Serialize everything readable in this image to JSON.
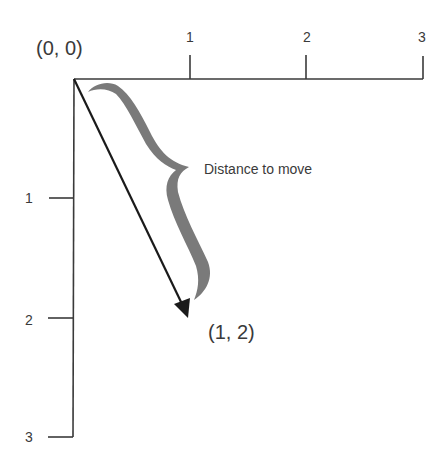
{
  "diagram": {
    "title": "",
    "origin": {
      "label": "(0, 0)",
      "px": [
        74,
        79
      ]
    },
    "x_axis": {
      "ticks": [
        {
          "label": "1",
          "px": 190
        },
        {
          "label": "2",
          "px": 306
        },
        {
          "label": "3",
          "px": 423
        }
      ]
    },
    "y_axis": {
      "ticks": [
        {
          "label": "1",
          "px": 198
        },
        {
          "label": "2",
          "px": 318
        },
        {
          "label": "3",
          "px": 437
        }
      ]
    },
    "vector": {
      "from": "(0, 0)",
      "to_label": "(1, 2)",
      "color": "#1a1a1a"
    },
    "brace": {
      "label": "Distance to move",
      "color": "#7a7a7a"
    },
    "colors": {
      "axis": "#3a3a3a",
      "text": "#3a3a3a",
      "background": "#ffffff"
    }
  }
}
